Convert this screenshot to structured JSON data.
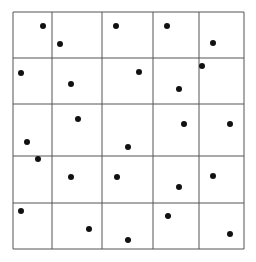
{
  "diagram": {
    "type": "grid-with-points",
    "colors": {
      "line": "#555555",
      "dot": "#111111",
      "background": "#ffffff"
    },
    "grid": {
      "x_lines": [
        13,
        52,
        102,
        153,
        199,
        244
      ],
      "y_lines": [
        12,
        58,
        104,
        156,
        203,
        249
      ],
      "rows": 5,
      "cols": 5
    },
    "points": [
      [
        43,
        26
      ],
      [
        60,
        44
      ],
      [
        116,
        26
      ],
      [
        167,
        26
      ],
      [
        213,
        43
      ],
      [
        21,
        73
      ],
      [
        71,
        84
      ],
      [
        139,
        72
      ],
      [
        202,
        66
      ],
      [
        179,
        89
      ],
      [
        78,
        119
      ],
      [
        27,
        142
      ],
      [
        128,
        147
      ],
      [
        184,
        124
      ],
      [
        230,
        124
      ],
      [
        38,
        159
      ],
      [
        71,
        177
      ],
      [
        117,
        177
      ],
      [
        179,
        187
      ],
      [
        213,
        176
      ],
      [
        21,
        211
      ],
      [
        89,
        229
      ],
      [
        128,
        240
      ],
      [
        168,
        216
      ],
      [
        230,
        234
      ]
    ],
    "dot_radius": 3
  }
}
